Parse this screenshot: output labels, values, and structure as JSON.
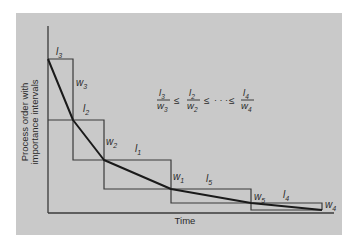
{
  "figure": {
    "background": "#ffffff",
    "panel_color": "#c9c9c9",
    "line_color": "#3a3a3a",
    "curve_color": "#1a1a1a",
    "y_axis_label_line1": "Process order with",
    "y_axis_label_line2": "importance intervals",
    "x_axis_label": "Time",
    "formula": {
      "terms": [
        {
          "num": "l",
          "num_sub": "3",
          "den": "w",
          "den_sub": "3"
        },
        {
          "num": "l",
          "num_sub": "2",
          "den": "w",
          "den_sub": "2"
        },
        {
          "num": "l",
          "num_sub": "4",
          "den": "w",
          "den_sub": "4"
        }
      ],
      "leq1": "≤",
      "leq2": "≤",
      "ellipsis": "· · ·",
      "leq3": "≤"
    },
    "step_labels": {
      "l3": {
        "main": "l",
        "sub": "3"
      },
      "w3": {
        "main": "w",
        "sub": "3"
      },
      "l2": {
        "main": "l",
        "sub": "2"
      },
      "w2": {
        "main": "w",
        "sub": "2"
      },
      "l1": {
        "main": "l",
        "sub": "1"
      },
      "w1": {
        "main": "w",
        "sub": "1"
      },
      "l5": {
        "main": "l",
        "sub": "5"
      },
      "w5": {
        "main": "w",
        "sub": "5"
      },
      "l4": {
        "main": "l",
        "sub": "4"
      },
      "w4": {
        "main": "w",
        "sub": "4"
      }
    }
  }
}
